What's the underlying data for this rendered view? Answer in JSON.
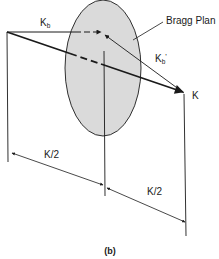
{
  "diagram": {
    "caption": "(b)",
    "labels": {
      "kb": "K",
      "kb_sub": "b",
      "kb_prime": "K",
      "kb_prime_sub": "b",
      "kb_prime_mark": "'",
      "k": "K",
      "bragg_plane": "Bragg Plan",
      "half_k_left": "K/2",
      "half_k_right": "K/2"
    },
    "colors": {
      "line": "#1a1a1a",
      "hatch": "#6a6a6a",
      "background": "#ffffff"
    }
  }
}
